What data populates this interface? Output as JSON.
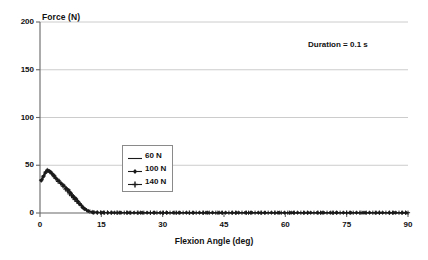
{
  "chart_data": {
    "type": "line",
    "title": "",
    "xlabel": "Flexion Angle (deg)",
    "ylabel": "Force (N)",
    "xlim": [
      0,
      90
    ],
    "ylim": [
      0,
      200
    ],
    "xticks": [
      "0",
      "15",
      "30",
      "45",
      "60",
      "75",
      "90"
    ],
    "yticks": [
      "0",
      "50",
      "100",
      "150",
      "200"
    ],
    "grid": "horizontal",
    "legend_position": "center-left-inside",
    "annotations": [
      {
        "text": "Duration = 0.1 s",
        "x": 62,
        "y": 178
      }
    ],
    "series": [
      {
        "name": "60 N",
        "marker": "none",
        "color": "#1a1a1a",
        "x": [
          0.3,
          0.7,
          1.1,
          1.5,
          1.9,
          2.3,
          2.7,
          3.1,
          3.6,
          4.1,
          4.6,
          5.2,
          5.8,
          6.4,
          7.0,
          7.6,
          8.2,
          8.8,
          9.4,
          10.0,
          10.6,
          11.3,
          12.0,
          13.0,
          14.5,
          16.0,
          18.0,
          20.5,
          23.0,
          26.0,
          29.0,
          32.0,
          35.5,
          39.0,
          42.5,
          46.0,
          49.5,
          53.0,
          56.5,
          60.0,
          63.5,
          67.0,
          70.5,
          74.0,
          77.5,
          81.0,
          84.5,
          88.0,
          90.0
        ],
        "y": [
          33,
          36,
          40,
          43,
          45,
          44,
          42,
          40,
          37,
          35,
          33,
          31,
          29,
          27,
          25,
          22,
          19,
          16,
          13,
          10,
          7,
          4,
          2,
          1,
          0.6,
          0.5,
          0.4,
          0.4,
          0.3,
          0.3,
          0.3,
          0.3,
          0.3,
          0.3,
          0.3,
          0.3,
          0.3,
          0.3,
          0.3,
          0.3,
          0.3,
          0.3,
          0.3,
          0.3,
          0.3,
          0.3,
          0.3,
          0.3,
          0.3
        ]
      },
      {
        "name": "100 N",
        "marker": "diamond",
        "color": "#1a1a1a",
        "x": [
          0.3,
          0.8,
          1.3,
          1.8,
          2.2,
          2.6,
          3.0,
          3.5,
          4.0,
          4.6,
          5.2,
          5.8,
          6.4,
          7.0,
          7.5,
          8.0,
          8.4,
          8.8,
          9.3,
          9.8,
          10.4,
          11.0,
          11.8,
          12.8,
          14.0,
          15.5,
          17.5,
          19.5,
          22.0,
          25.0,
          28.0,
          31.0,
          34.0,
          37.5,
          41.0,
          44.5,
          48.0,
          51.5,
          55.0,
          58.5,
          62.0,
          65.5,
          69.0,
          72.5,
          76.0,
          79.5,
          83.0,
          86.5,
          89.5
        ],
        "y": [
          34,
          38,
          42,
          45,
          44,
          43,
          41,
          39,
          36,
          34,
          31,
          29,
          26,
          24,
          21,
          18,
          16,
          15,
          12,
          9,
          6,
          4,
          2,
          1,
          0.6,
          0.5,
          0.4,
          0.4,
          0.3,
          0.3,
          0.3,
          0.3,
          0.3,
          0.3,
          0.3,
          0.3,
          0.3,
          0.3,
          0.3,
          0.3,
          0.3,
          0.3,
          0.3,
          0.3,
          0.3,
          0.3,
          0.3,
          0.3,
          0.3
        ]
      },
      {
        "name": "140 N",
        "marker": "plus",
        "color": "#1a1a1a",
        "x": [
          0.4,
          0.9,
          1.4,
          1.9,
          2.4,
          2.9,
          3.4,
          3.9,
          4.4,
          5.0,
          5.6,
          6.2,
          6.7,
          7.2,
          7.7,
          8.1,
          8.5,
          9.0,
          9.5,
          10.1,
          10.7,
          11.4,
          12.2,
          13.2,
          14.8,
          16.5,
          18.8,
          21.2,
          24.0,
          27.0,
          30.0,
          33.0,
          36.5,
          40.0,
          43.5,
          47.0,
          50.5,
          54.0,
          57.5,
          61.0,
          64.5,
          68.0,
          71.5,
          75.0,
          78.5,
          82.0,
          85.5,
          88.5,
          90.0
        ],
        "y": [
          35,
          39,
          43,
          44,
          43,
          41,
          38,
          36,
          33,
          31,
          28,
          25,
          23,
          20,
          18,
          16,
          14,
          12,
          10,
          8,
          5,
          3,
          1.5,
          0.8,
          0.5,
          0.5,
          0.4,
          0.4,
          0.3,
          0.3,
          0.3,
          0.3,
          0.3,
          0.3,
          0.3,
          0.3,
          0.3,
          0.3,
          0.3,
          0.3,
          0.3,
          0.3,
          0.3,
          0.3,
          0.3,
          0.3,
          0.3,
          0.3,
          0.3
        ]
      }
    ],
    "baseline_markers_x": [
      13.0,
      14.0,
      15.0,
      15.8,
      16.6,
      17.4,
      18.2,
      19.0,
      19.8,
      20.6,
      21.4,
      22.2,
      23.0,
      23.8,
      24.6,
      25.4,
      26.2,
      27.0,
      27.8,
      28.6,
      29.4,
      30.2,
      31.0,
      31.8,
      32.6,
      33.4,
      34.2,
      35.0,
      35.8,
      36.6,
      37.4,
      38.2,
      39.0,
      39.8,
      40.6,
      41.4,
      42.2,
      43.0,
      43.8,
      44.6,
      45.4,
      46.2,
      47.0,
      47.8,
      48.6,
      49.4,
      50.2,
      51.0,
      51.8,
      52.6,
      53.4,
      54.2,
      55.0,
      55.8,
      56.6,
      57.4,
      58.2,
      59.0,
      59.8,
      60.6,
      61.4,
      62.2,
      63.0,
      63.8,
      64.6,
      65.4,
      66.2,
      67.0,
      67.8,
      68.6,
      69.4,
      70.2,
      71.0,
      71.8,
      72.6,
      73.4,
      74.2,
      75.0,
      75.8,
      76.6,
      77.4,
      78.2,
      79.0,
      79.8,
      80.6,
      81.4,
      82.2,
      83.0,
      83.8,
      84.6,
      85.4,
      86.2,
      87.0,
      87.8,
      88.6,
      89.4
    ]
  },
  "axis": {
    "y_title": "Force (N)",
    "x_title": "Flexion Angle (deg)"
  },
  "annotation": {
    "duration": "Duration = 0.1 s"
  },
  "legend": {
    "items": [
      {
        "label": "60 N",
        "marker": "line"
      },
      {
        "label": "100 N",
        "marker": "diamond"
      },
      {
        "label": "140 N",
        "marker": "plus"
      }
    ]
  },
  "colors": {
    "series": "#1a1a1a",
    "grid": "#bfbfbf",
    "axis": "#666666",
    "text": "#111111"
  }
}
